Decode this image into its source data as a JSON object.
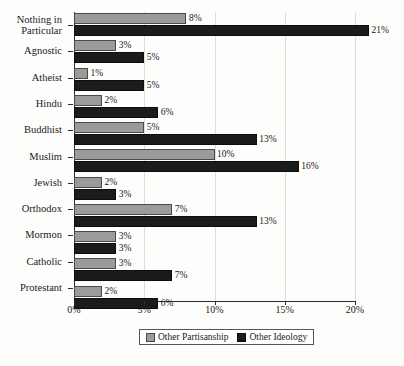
{
  "chart_data": {
    "type": "bar",
    "orientation": "horizontal",
    "title": "",
    "xlabel": "",
    "ylabel": "",
    "xlim": [
      0,
      21
    ],
    "xticks": [
      "0%",
      "5%",
      "10%",
      "15%",
      "20%"
    ],
    "xtick_values": [
      0,
      5,
      10,
      15,
      20
    ],
    "grid": true,
    "legend_position": "bottom-center",
    "categories": [
      "Nothing in Particular",
      "Agnostic",
      "Atheist",
      "Hindu",
      "Buddhist",
      "Muslim",
      "Jewish",
      "Orthodox",
      "Mormon",
      "Catholic",
      "Protestant"
    ],
    "series": [
      {
        "name": "Other Partisanship",
        "color": "#9b9b9b",
        "values": [
          8,
          3,
          1,
          2,
          5,
          10,
          2,
          7,
          3,
          3,
          2
        ],
        "labels": [
          "8%",
          "3%",
          "1%",
          "2%",
          "5%",
          "10%",
          "2%",
          "7%",
          "3%",
          "3%",
          "2%"
        ]
      },
      {
        "name": "Other Ideology",
        "color": "#1b1b1b",
        "values": [
          21,
          5,
          5,
          6,
          13,
          16,
          3,
          13,
          3,
          7,
          6
        ],
        "labels": [
          "21%",
          "5%",
          "5%",
          "6%",
          "13%",
          "16%",
          "3%",
          "13%",
          "3%",
          "7%",
          "6%"
        ]
      }
    ]
  },
  "legend": {
    "items": [
      {
        "label": "Other Partisanship",
        "swatch": "gray-swatch"
      },
      {
        "label": "Other Ideology",
        "swatch": "black-swatch"
      }
    ]
  }
}
